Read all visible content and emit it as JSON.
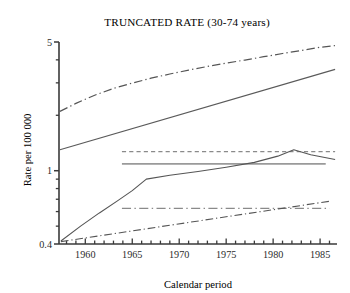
{
  "chart_data": {
    "type": "line",
    "title": "TRUNCATED RATE (30-74 years)",
    "xlabel": "Calendar period",
    "ylabel": "Rate per 100 000",
    "xlim": [
      1957.2,
      1986.8
    ],
    "ylim": [
      0.4,
      5
    ],
    "yscale": "log",
    "grid": false,
    "legend": "none",
    "xticks": [
      1960,
      1965,
      1970,
      1975,
      1980,
      1985
    ],
    "xtick_labels": [
      "1960",
      "1965",
      "1970",
      "1975",
      "1980",
      "1985"
    ],
    "xtick_minor_step": 1,
    "yticks": [
      0.4,
      1,
      5
    ],
    "ytick_labels": [
      "0.4",
      "1",
      "5"
    ],
    "ytick_minor": [
      0.5,
      0.6,
      0.7,
      0.8,
      0.9,
      2,
      3,
      4
    ],
    "series": [
      {
        "name": "upper-dashdot-curve",
        "style": "dashdot",
        "color": "#555555",
        "width": 1.2,
        "x": [
          1957.3,
          1959.0,
          1961.0,
          1963.0,
          1965.0,
          1967.0,
          1969.0,
          1971.0,
          1973.0,
          1975.0,
          1977.0,
          1979.0,
          1981.0,
          1983.0,
          1985.0,
          1986.6
        ],
        "y": [
          2.1,
          2.32,
          2.57,
          2.8,
          2.99,
          3.18,
          3.35,
          3.52,
          3.68,
          3.84,
          3.99,
          4.16,
          4.33,
          4.5,
          4.68,
          4.78
        ]
      },
      {
        "name": "upper-solid-line",
        "style": "solid",
        "color": "#5a5a5a",
        "width": 1.2,
        "x": [
          1957.3,
          1986.6
        ],
        "y": [
          1.3,
          3.55
        ]
      },
      {
        "name": "mid-dashed-horizontal",
        "style": "dashed",
        "color": "#8a8a8a",
        "width": 1.3,
        "x": [
          1963.9,
          1986.6
        ],
        "y": [
          1.27,
          1.27
        ]
      },
      {
        "name": "mid-solid-horizontal",
        "style": "solid",
        "color": "#9a9a9a",
        "width": 1.6,
        "x": [
          1963.9,
          1985.6
        ],
        "y": [
          1.09,
          1.09
        ]
      },
      {
        "name": "mid-rising-solid-curve",
        "style": "solid",
        "color": "#555555",
        "width": 1.1,
        "x": [
          1957.4,
          1959.5,
          1961.5,
          1963.5,
          1965.0,
          1966.5,
          1969.0,
          1972.0,
          1975.0,
          1978.0,
          1980.5,
          1982.2,
          1984.0,
          1986.6
        ],
        "y": [
          0.415,
          0.5,
          0.59,
          0.69,
          0.78,
          0.9,
          0.945,
          0.99,
          1.045,
          1.11,
          1.2,
          1.3,
          1.22,
          1.15
        ]
      },
      {
        "name": "lower-dashdot-horizontal",
        "style": "dashdot",
        "color": "#8a8a8a",
        "width": 1.3,
        "x": [
          1963.9,
          1986.0
        ],
        "y": [
          0.625,
          0.625
        ]
      },
      {
        "name": "lower-rising-dashdot",
        "style": "dashdot",
        "color": "#555555",
        "width": 1.1,
        "x": [
          1957.4,
          1986.2
        ],
        "y": [
          0.412,
          0.685
        ]
      }
    ]
  }
}
